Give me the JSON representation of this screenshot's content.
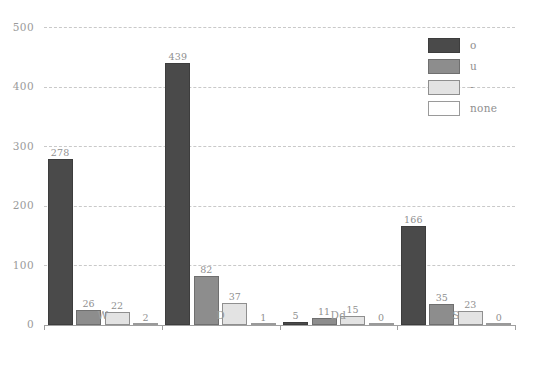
{
  "chart_data": {
    "type": "bar",
    "title": "",
    "subtitle": "",
    "xlabel": "",
    "ylabel": "",
    "categories": [
      "W",
      "D",
      "Dd",
      "S"
    ],
    "series": [
      {
        "name": "o",
        "color": "#4a4a4a",
        "values": [
          278,
          439,
          5,
          166
        ]
      },
      {
        "name": "u",
        "color": "#8d8d8d",
        "values": [
          26,
          82,
          11,
          35
        ]
      },
      {
        "name": "-",
        "color": "#e3e3e3",
        "values": [
          22,
          37,
          15,
          23
        ]
      },
      {
        "name": "none",
        "color": "#ffffff",
        "values": [
          2,
          1,
          0,
          0
        ]
      }
    ],
    "ylim": [
      0,
      500
    ],
    "yticks": [
      0,
      100,
      200,
      300,
      400,
      500
    ],
    "ytick_labels": [
      "0",
      "100",
      "200",
      "300",
      "400",
      "500"
    ],
    "grid": "horizontal-dashed",
    "legend_position": "top-right",
    "data_labels": true,
    "data_label_values": [
      [
        "278",
        "26",
        "22",
        "2"
      ],
      [
        "439",
        "82",
        "37",
        "1"
      ],
      [
        "5",
        "11",
        "15",
        "0"
      ],
      [
        "166",
        "35",
        "23",
        "0"
      ]
    ]
  },
  "legend": {
    "items": [
      {
        "label": "o"
      },
      {
        "label": "u"
      },
      {
        "label": "-"
      },
      {
        "label": "none"
      }
    ]
  },
  "axes": {
    "y_tick_labels": [
      "500",
      "400",
      "300",
      "200",
      "100",
      "0"
    ],
    "x_group_labels": [
      "W",
      "D",
      "Dd",
      "S"
    ]
  },
  "caption": {
    "text": ""
  }
}
